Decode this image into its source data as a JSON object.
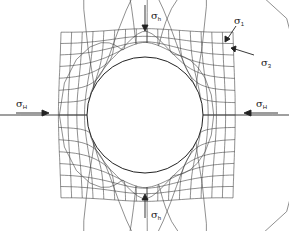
{
  "diagram": {
    "type": "borehole stress concentration with deformed grid",
    "colors": {
      "line": "#333333",
      "background": "#ffffff"
    },
    "labels": {
      "sigma_h_top": {
        "symbol": "σ",
        "sub": "h"
      },
      "sigma_h_bottom": {
        "symbol": "σ",
        "sub": "h"
      },
      "sigma_H_left": {
        "symbol": "σ",
        "sub": "H"
      },
      "sigma_H_right": {
        "symbol": "σ",
        "sub": "H"
      },
      "sigma_1": {
        "symbol": "σ",
        "sub": "1"
      },
      "sigma_3": {
        "symbol": "σ",
        "sub": "3"
      }
    },
    "borehole": {
      "cx": 145,
      "cy": 115,
      "r": 58
    },
    "grid": {
      "x0": 62,
      "x1": 232,
      "y0": 38,
      "y1": 192,
      "cols": 16,
      "rows": 14
    }
  }
}
